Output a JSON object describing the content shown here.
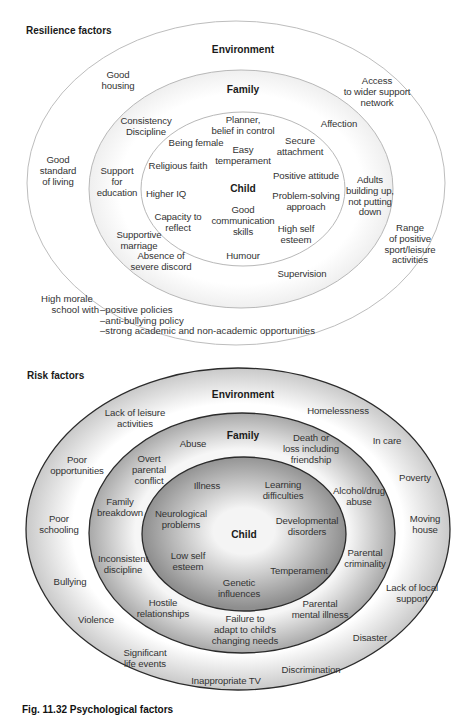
{
  "resilience": {
    "title": "Resilience factors",
    "rings": {
      "environment": "Environment",
      "family": "Family",
      "child": "Child"
    },
    "environment_items": [
      {
        "id": "good-housing",
        "lines": [
          "Good",
          "housing"
        ]
      },
      {
        "id": "access-support",
        "lines": [
          "Access",
          "to wider support",
          "network"
        ]
      },
      {
        "id": "good-standard",
        "lines": [
          "Good",
          "standard",
          "of living"
        ]
      },
      {
        "id": "range-activities",
        "lines": [
          "Range",
          "of positive",
          "sport/leisure",
          "activities"
        ]
      }
    ],
    "school": {
      "lead_line1": "High morale",
      "lead_line2": "school with",
      "bullets": [
        "–positive policies",
        "–anti-bullying policy",
        "–strong academic and non-academic opportunities"
      ]
    },
    "family_items": [
      {
        "id": "consistency",
        "lines": [
          "Consistency",
          "Discipline"
        ]
      },
      {
        "id": "affection",
        "lines": [
          "Affection"
        ]
      },
      {
        "id": "support-education",
        "lines": [
          "Support",
          "for",
          "education"
        ]
      },
      {
        "id": "adults-building",
        "lines": [
          "Adults",
          "building up,",
          "not putting",
          "down"
        ]
      },
      {
        "id": "supportive-marriage",
        "lines": [
          "Supportive",
          "marriage"
        ]
      },
      {
        "id": "absence-discord",
        "lines": [
          "Absence of",
          "severe discord"
        ]
      },
      {
        "id": "supervision",
        "lines": [
          "Supervision"
        ]
      }
    ],
    "child_items": [
      {
        "id": "planner",
        "lines": [
          "Planner,",
          "belief in control"
        ]
      },
      {
        "id": "being-female",
        "lines": [
          "Being female"
        ]
      },
      {
        "id": "easy-temperament",
        "lines": [
          "Easy",
          "temperament"
        ]
      },
      {
        "id": "secure-attachment",
        "lines": [
          "Secure",
          "attachment"
        ]
      },
      {
        "id": "religious-faith",
        "lines": [
          "Religious faith"
        ]
      },
      {
        "id": "positive-attitude",
        "lines": [
          "Positive attitude"
        ]
      },
      {
        "id": "higher-iq",
        "lines": [
          "Higher IQ"
        ]
      },
      {
        "id": "problem-solving",
        "lines": [
          "Problem-solving",
          "approach"
        ]
      },
      {
        "id": "capacity-reflect",
        "lines": [
          "Capacity to",
          "reflect"
        ]
      },
      {
        "id": "good-communication",
        "lines": [
          "Good",
          "communication",
          "skills"
        ]
      },
      {
        "id": "high-self-esteem",
        "lines": [
          "High self",
          "esteem"
        ]
      },
      {
        "id": "humour",
        "lines": [
          "Humour"
        ]
      }
    ]
  },
  "risk": {
    "title": "Risk factors",
    "rings": {
      "environment": "Environment",
      "family": "Family",
      "child": "Child"
    },
    "environment_items": [
      {
        "id": "lack-leisure",
        "lines": [
          "Lack of leisure",
          "activities"
        ]
      },
      {
        "id": "homelessness",
        "lines": [
          "Homelessness"
        ]
      },
      {
        "id": "in-care",
        "lines": [
          "In care"
        ]
      },
      {
        "id": "poor-opportunities",
        "lines": [
          "Poor",
          "opportunities"
        ]
      },
      {
        "id": "poverty",
        "lines": [
          "Poverty"
        ]
      },
      {
        "id": "poor-schooling",
        "lines": [
          "Poor",
          "schooling"
        ]
      },
      {
        "id": "moving-house",
        "lines": [
          "Moving",
          "house"
        ]
      },
      {
        "id": "bullying",
        "lines": [
          "Bullying"
        ]
      },
      {
        "id": "lack-local-support",
        "lines": [
          "Lack of local",
          "support"
        ]
      },
      {
        "id": "violence",
        "lines": [
          "Violence"
        ]
      },
      {
        "id": "disaster",
        "lines": [
          "Disaster"
        ]
      },
      {
        "id": "significant-events",
        "lines": [
          "Significant",
          "life events"
        ]
      },
      {
        "id": "discrimination",
        "lines": [
          "Discrimination"
        ]
      },
      {
        "id": "inappropriate-tv",
        "lines": [
          "Inappropriate TV"
        ]
      }
    ],
    "family_items": [
      {
        "id": "abuse",
        "lines": [
          "Abuse"
        ]
      },
      {
        "id": "death-loss",
        "lines": [
          "Death or",
          "loss including",
          "friendship"
        ]
      },
      {
        "id": "overt-conflict",
        "lines": [
          "Overt",
          "parental",
          "conflict"
        ]
      },
      {
        "id": "alcohol-drug",
        "lines": [
          "Alcohol/drug",
          "abuse"
        ]
      },
      {
        "id": "family-breakdown",
        "lines": [
          "Family",
          "breakdown"
        ]
      },
      {
        "id": "inconsistent-discipline",
        "lines": [
          "Inconsistent",
          "discipline"
        ]
      },
      {
        "id": "parental-criminality",
        "lines": [
          "Parental",
          "criminality"
        ]
      },
      {
        "id": "hostile-relationships",
        "lines": [
          "Hostile",
          "relationships"
        ]
      },
      {
        "id": "parental-mental-illness",
        "lines": [
          "Parental",
          "mental illness"
        ]
      },
      {
        "id": "failure-adapt",
        "lines": [
          "Failure to",
          "adapt to child's",
          "changing needs"
        ]
      }
    ],
    "child_items": [
      {
        "id": "illness",
        "lines": [
          "Illness"
        ]
      },
      {
        "id": "learning-difficulties",
        "lines": [
          "Learning",
          "difficulties"
        ]
      },
      {
        "id": "neurological",
        "lines": [
          "Neurological",
          "problems"
        ]
      },
      {
        "id": "developmental",
        "lines": [
          "Developmental",
          "disorders"
        ]
      },
      {
        "id": "low-self-esteem",
        "lines": [
          "Low self",
          "esteem"
        ]
      },
      {
        "id": "temperament",
        "lines": [
          "Temperament"
        ]
      },
      {
        "id": "genetic",
        "lines": [
          "Genetic",
          "influences"
        ]
      }
    ]
  },
  "caption": "Fig. 11.32 Psychological factors",
  "colors": {
    "resilience_stroke": "#b8b8b8",
    "risk_stroke": "#2b2b2b",
    "risk_shade": "#9a9a9a",
    "text": "#333333"
  }
}
